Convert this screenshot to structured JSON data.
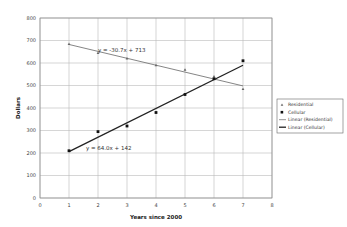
{
  "chart_data": {
    "type": "scatter",
    "title": "",
    "xlabel": "Years since 2000",
    "ylabel": "Dollars",
    "xlim": [
      0,
      8
    ],
    "ylim": [
      0,
      800
    ],
    "x_ticks": [
      "0",
      "1",
      "2",
      "3",
      "4",
      "5",
      "6",
      "7",
      "8"
    ],
    "y_ticks": [
      "0",
      "100",
      "200",
      "300",
      "400",
      "500",
      "600",
      "700",
      "800"
    ],
    "grid": true,
    "legend_position": "right",
    "series": [
      {
        "name": "Residential",
        "marker": "triangle",
        "x": [
          1,
          2,
          3,
          4,
          5,
          6,
          7
        ],
        "values": [
          685,
          645,
          620,
          590,
          570,
          540,
          485
        ]
      },
      {
        "name": "Cellular",
        "marker": "square",
        "x": [
          1,
          2,
          3,
          4,
          5,
          6,
          7
        ],
        "values": [
          210,
          295,
          320,
          380,
          460,
          530,
          610
        ]
      }
    ],
    "trendlines": [
      {
        "name": "Linear (Residential)",
        "slope": -30.7,
        "intercept": 713,
        "equation": "y = -30.7x + 713",
        "x_range": [
          1,
          7
        ]
      },
      {
        "name": "Linear (Cellular)",
        "slope": 64.0,
        "intercept": 142,
        "equation": "y = 64.0x + 142",
        "x_range": [
          1,
          7
        ]
      }
    ],
    "legend": [
      "Residential",
      "Cellular",
      "Linear (Residential)",
      "Linear (Cellular)"
    ]
  }
}
